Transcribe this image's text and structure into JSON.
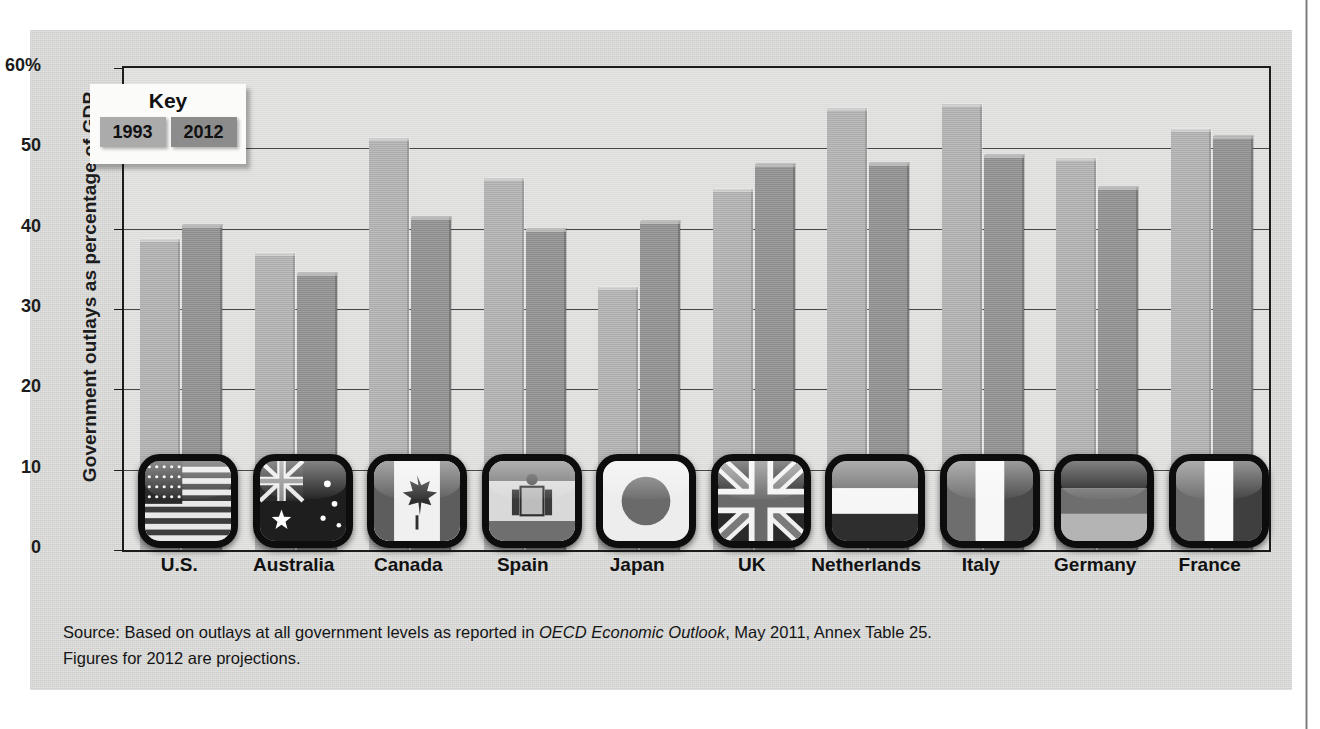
{
  "chart_data": {
    "type": "bar",
    "title": "",
    "xlabel": "",
    "ylabel": "Government outlays as percentage of GDP",
    "ylim": [
      0,
      60
    ],
    "ytick_labels": [
      "60%",
      "50",
      "40",
      "30",
      "20",
      "10",
      "0"
    ],
    "ytick_values": [
      60,
      50,
      40,
      30,
      20,
      10,
      0
    ],
    "grid": true,
    "legend_position": "inside-top-left",
    "categories": [
      "U.S.",
      "Australia",
      "Canada",
      "Spain",
      "Japan",
      "UK",
      "Netherlands",
      "Italy",
      "Germany",
      "France"
    ],
    "series": [
      {
        "name": "1993",
        "color": "#ababab",
        "values": [
          38.7,
          37.0,
          51.3,
          46.3,
          32.8,
          45.0,
          55.0,
          55.5,
          48.8,
          52.4
        ]
      },
      {
        "name": "2012",
        "color": "#8c8c8c",
        "values": [
          40.5,
          34.5,
          41.5,
          40.0,
          41.0,
          48.0,
          48.2,
          49.2,
          45.2,
          51.5
        ]
      }
    ],
    "flag_icons": [
      "flag-united-states",
      "flag-australia",
      "flag-canada",
      "flag-spain",
      "flag-japan",
      "flag-united-kingdom",
      "flag-netherlands",
      "flag-italy",
      "flag-germany",
      "flag-france"
    ]
  },
  "key": {
    "title": "Key",
    "items": [
      {
        "label": "1993",
        "color": "#ababab"
      },
      {
        "label": "2012",
        "color": "#8c8c8c"
      }
    ]
  },
  "source": {
    "line1_prefix": "Source: Based on outlays at all government levels as reported in ",
    "line1_italic": "OECD Economic Outlook",
    "line1_suffix": ", May 2011, Annex Table 25.",
    "line2": "Figures for 2012 are projections."
  }
}
